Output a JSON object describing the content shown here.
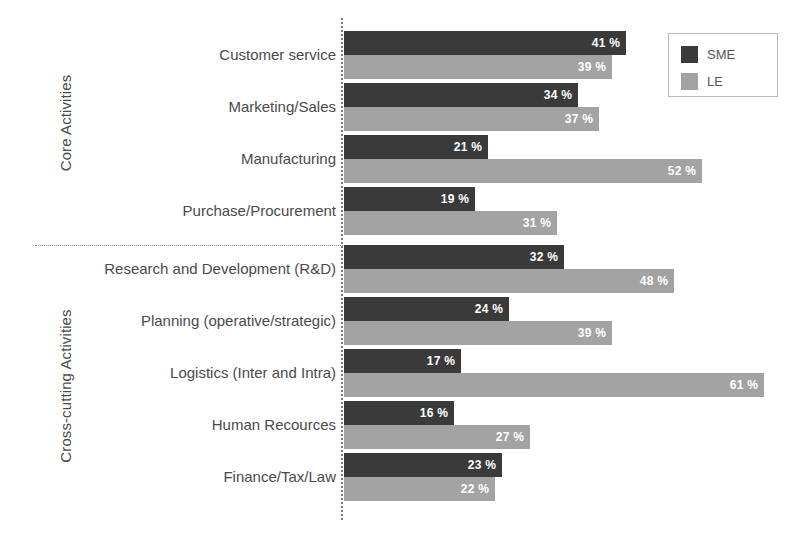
{
  "chart_data": {
    "type": "bar",
    "orientation": "horizontal",
    "title": "",
    "xlabel": "",
    "ylabel": "",
    "xlim": [
      0,
      65
    ],
    "grid": false,
    "value_suffix": " %",
    "legend_position": "top-right",
    "legend": [
      {
        "name": "SME",
        "color": "#3a3a3a"
      },
      {
        "name": "LE",
        "color": "#a3a3a3"
      }
    ],
    "categories": [
      "Customer service",
      "Marketing/Sales",
      "Manufacturing",
      "Purchase/Procurement",
      "Research and Development (R&D)",
      "Planning (operative/strategic)",
      "Logistics (Inter and Intra)",
      "Human Recources",
      "Finance/Tax/Law"
    ],
    "series": [
      {
        "name": "SME",
        "color": "#3a3a3a",
        "values": [
          41,
          34,
          21,
          19,
          32,
          24,
          17,
          16,
          23
        ]
      },
      {
        "name": "LE",
        "color": "#a3a3a3",
        "values": [
          39,
          37,
          52,
          31,
          48,
          39,
          61,
          27,
          22
        ]
      }
    ],
    "groups": [
      {
        "label": "Core Activities",
        "categories": [
          "Customer service",
          "Marketing/Sales",
          "Manufacturing",
          "Purchase/Procurement"
        ]
      },
      {
        "label": "Cross-cutting Activities",
        "categories": [
          "Research and Development (R&D)",
          "Planning (operative/strategic)",
          "Logistics (Inter and Intra)",
          "Human Recources",
          "Finance/Tax/Law"
        ]
      }
    ]
  },
  "rows": [
    {
      "category": "Customer service",
      "sme": 41,
      "le": 39,
      "sme_label": "41 %",
      "le_label": "39 %"
    },
    {
      "category": "Marketing/Sales",
      "sme": 34,
      "le": 37,
      "sme_label": "34 %",
      "le_label": "37 %"
    },
    {
      "category": "Manufacturing",
      "sme": 21,
      "le": 52,
      "sme_label": "21 %",
      "le_label": "52 %"
    },
    {
      "category": "Purchase/Procurement",
      "sme": 19,
      "le": 31,
      "sme_label": "19 %",
      "le_label": "31 %"
    },
    {
      "category": "Research and Development (R&D)",
      "sme": 32,
      "le": 48,
      "sme_label": "32 %",
      "le_label": "48 %"
    },
    {
      "category": "Planning (operative/strategic)",
      "sme": 24,
      "le": 39,
      "sme_label": "24 %",
      "le_label": "39 %"
    },
    {
      "category": "Logistics (Inter and Intra)",
      "sme": 17,
      "le": 61,
      "sme_label": "17 %",
      "le_label": "61 %"
    },
    {
      "category": "Human Recources",
      "sme": 16,
      "le": 27,
      "sme_label": "16 %",
      "le_label": "27 %"
    },
    {
      "category": "Finance/Tax/Law",
      "sme": 23,
      "le": 22,
      "sme_label": "23 %",
      "le_label": "22 %"
    }
  ],
  "groups": {
    "core": {
      "label": "Core Activities"
    },
    "cross": {
      "label": "Cross-cutting Activities"
    }
  },
  "legend": {
    "sme": {
      "label": "SME",
      "color": "#3a3a3a"
    },
    "le": {
      "label": "LE",
      "color": "#a3a3a3"
    }
  }
}
